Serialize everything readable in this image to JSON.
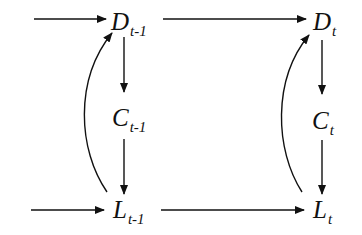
{
  "diagram": {
    "type": "flow-diagram",
    "line_color": "#111111",
    "background": "#ffffff",
    "nodes": {
      "D_prev": {
        "base": "D",
        "sub": "t-1"
      },
      "C_prev": {
        "base": "C",
        "sub": "t-1"
      },
      "L_prev": {
        "base": "L",
        "sub": "t-1"
      },
      "D_curr": {
        "base": "D",
        "sub": "t"
      },
      "C_curr": {
        "base": "C",
        "sub": "t"
      },
      "L_curr": {
        "base": "L",
        "sub": "t"
      }
    },
    "edges": [
      {
        "from": "input",
        "to": "D_prev",
        "shape": "straight"
      },
      {
        "from": "D_prev",
        "to": "D_curr",
        "shape": "straight"
      },
      {
        "from": "D_prev",
        "to": "C_prev",
        "shape": "straight"
      },
      {
        "from": "C_prev",
        "to": "L_prev",
        "shape": "straight"
      },
      {
        "from": "L_prev",
        "to": "D_prev",
        "shape": "curved"
      },
      {
        "from": "input",
        "to": "L_prev",
        "shape": "straight"
      },
      {
        "from": "L_prev",
        "to": "L_curr",
        "shape": "straight"
      },
      {
        "from": "D_curr",
        "to": "C_curr",
        "shape": "straight"
      },
      {
        "from": "C_curr",
        "to": "L_curr",
        "shape": "straight"
      },
      {
        "from": "L_curr",
        "to": "D_curr",
        "shape": "curved"
      }
    ]
  }
}
